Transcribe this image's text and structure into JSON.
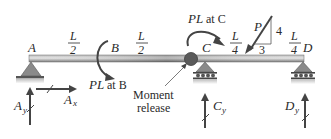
{
  "diagram": {
    "type": "beam-free-body-diagram",
    "points": [
      {
        "id": "A",
        "label": "A",
        "support": "pin"
      },
      {
        "id": "B",
        "label": "B",
        "support": "none"
      },
      {
        "id": "C",
        "label": "C",
        "support": "roller"
      },
      {
        "id": "D",
        "label": "D",
        "support": "roller"
      }
    ],
    "spans": [
      {
        "from": "A",
        "to": "B",
        "num": "L",
        "den": "2"
      },
      {
        "from": "B",
        "to": "C",
        "num": "L",
        "den": "2"
      },
      {
        "from": "C",
        "to": "load",
        "num": "L",
        "den": "4"
      },
      {
        "from": "load",
        "to": "D",
        "num": "L",
        "den": "4"
      }
    ],
    "moments": [
      {
        "at": "B",
        "label_main": "PL",
        "label_rest": " at B",
        "direction": "clockwise"
      },
      {
        "at": "C",
        "label_main": "PL",
        "label_rest": " at C",
        "direction": "clockwise"
      }
    ],
    "point_load": {
      "label": "P",
      "slope_rise": "4",
      "slope_run": "3"
    },
    "moment_release": {
      "line1": "Moment",
      "line2": "release"
    },
    "reactions": [
      {
        "id": "Ay",
        "main": "A",
        "sub": "y",
        "direction": "up"
      },
      {
        "id": "Ax",
        "main": "A",
        "sub": "x",
        "direction": "right"
      },
      {
        "id": "Cy",
        "main": "C",
        "sub": "y",
        "direction": "up"
      },
      {
        "id": "Dy",
        "main": "D",
        "sub": "y",
        "direction": "up"
      }
    ],
    "colors": {
      "beam_light": "#d9d9d9",
      "beam_dark": "#6e6e6e",
      "support": "#8a8a8a",
      "hinge": "#5a5a5a",
      "arrow": "#444444",
      "text": "#2a2a2a"
    }
  }
}
